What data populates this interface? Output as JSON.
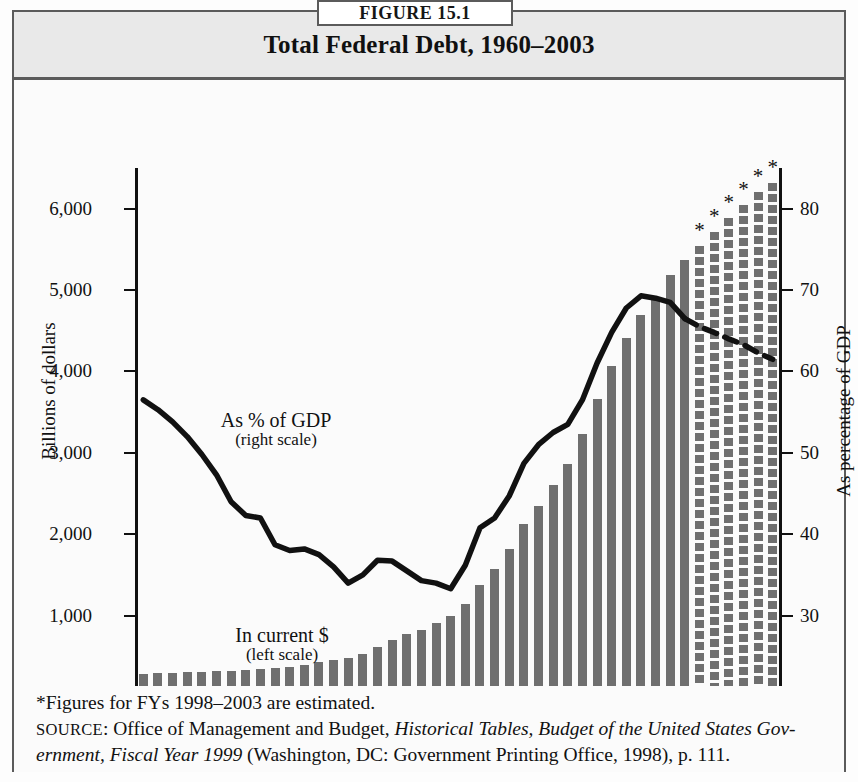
{
  "figure": {
    "tab_label": "FIGURE 15.1",
    "title": "Total Federal Debt, 1960–2003"
  },
  "axes": {
    "left_title": "Billions of dollars",
    "right_title": "As percentage of GDP",
    "x_title": "Year",
    "left_ticks": [
      "0",
      "1,000",
      "2,000",
      "3,000",
      "4,000",
      "5,000",
      "6,000"
    ],
    "right_ticks": [
      "20",
      "30",
      "40",
      "50",
      "60",
      "70",
      "80"
    ],
    "x_ticks": [
      "1960",
      "1965",
      "1970",
      "1975",
      "1980",
      "1985",
      "1990",
      "1995",
      "2000"
    ]
  },
  "annotations": {
    "gdp_main": "As % of GDP",
    "gdp_sub": "(right scale)",
    "current_main": "In current $",
    "current_sub": "(left scale)",
    "estimate_marker": "*"
  },
  "footnotes": {
    "estimate_note": "*Figures for FYs 1998–2003 are estimated.",
    "source_label": "SOURCE",
    "source_sep": ": ",
    "source_part1": "Office of Management and Budget, ",
    "source_italic1": "Historical Tables, Budget of the United States Gov-",
    "source_italic2": "ernment, Fiscal Year 1999",
    "source_part2": " (Washington, DC: Government Printing Office, 1998), p. 111."
  },
  "colors": {
    "bar_fill": "#6f6f6f",
    "line": "#111111",
    "frame": "#5b5b5b",
    "header_band": "#e9e9e9"
  },
  "chart_data": {
    "type": "bar",
    "title": "Total Federal Debt, 1960–2003",
    "xlabel": "Year",
    "ylabel": "Billions of dollars",
    "ylabel_secondary": "As percentage of GDP",
    "ylim": [
      0,
      6500
    ],
    "ylim_secondary": [
      20,
      85
    ],
    "grid": false,
    "legend": "inline-annotations",
    "categories": [
      1960,
      1961,
      1962,
      1963,
      1964,
      1965,
      1966,
      1967,
      1968,
      1969,
      1970,
      1971,
      1972,
      1973,
      1974,
      1975,
      1976,
      1977,
      1978,
      1979,
      1980,
      1981,
      1982,
      1983,
      1984,
      1985,
      1986,
      1987,
      1988,
      1989,
      1990,
      1991,
      1992,
      1993,
      1994,
      1995,
      1996,
      1997,
      1998,
      1999,
      2000,
      2001,
      2002,
      2003
    ],
    "series": [
      {
        "name": "In current $ (left scale)",
        "unit": "billions of dollars",
        "axis": "left",
        "style": "bar",
        "values": [
          286,
          289,
          298,
          306,
          312,
          317,
          320,
          326,
          348,
          354,
          371,
          398,
          427,
          458,
          475,
          533,
          620,
          699,
          772,
          827,
          908,
          998,
          1142,
          1377,
          1572,
          1823,
          2125,
          2350,
          2602,
          2857,
          3233,
          3665,
          4065,
          4411,
          4693,
          4921,
          5182,
          5370,
          5540,
          5710,
          5880,
          6050,
          6200,
          6320
        ]
      },
      {
        "name": "As % of GDP (right scale)",
        "unit": "percent of GDP",
        "axis": "right",
        "style": "line",
        "values": [
          56.5,
          55.3,
          53.8,
          52.0,
          49.8,
          47.3,
          44.0,
          42.3,
          42.0,
          38.7,
          38.0,
          38.2,
          37.5,
          36.0,
          34.0,
          35.0,
          36.8,
          36.7,
          35.5,
          34.3,
          34.0,
          33.3,
          36.2,
          40.8,
          42.0,
          44.7,
          48.7,
          51.0,
          52.5,
          53.5,
          56.5,
          61.0,
          64.8,
          67.8,
          69.3,
          69.0,
          68.5,
          66.5,
          65.5,
          64.8,
          64.0,
          63.3,
          62.3,
          61.5
        ]
      }
    ],
    "estimated_from": 1998,
    "estimated_to": 2003,
    "estimate_note": "*Figures for FYs 1998–2003 are estimated."
  }
}
